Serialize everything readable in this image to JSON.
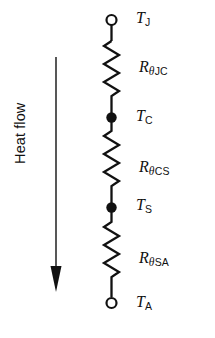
{
  "figure": {
    "colors": {
      "background": "#ffffff",
      "stroke": "#111111",
      "node_fill": "#111111",
      "terminal_fill": "#ffffff"
    }
  },
  "heat_flow": {
    "label": "Heat flow",
    "direction": "down",
    "arrow_icon": "down-arrow-icon"
  },
  "nodes": [
    {
      "id": "tj",
      "symbol": "T",
      "subscript": "J",
      "type": "terminal",
      "marker": "open-circle"
    },
    {
      "id": "tc",
      "symbol": "T",
      "subscript": "C",
      "type": "junction",
      "marker": "filled-dot"
    },
    {
      "id": "ts",
      "symbol": "T",
      "subscript": "S",
      "type": "junction",
      "marker": "filled-dot"
    },
    {
      "id": "ta",
      "symbol": "T",
      "subscript": "A",
      "type": "terminal",
      "marker": "open-circle"
    }
  ],
  "resistors": [
    {
      "id": "rjc",
      "symbol": "R",
      "sub_theta": "θ",
      "sub_rest": "JC",
      "between": [
        "tj",
        "tc"
      ]
    },
    {
      "id": "rcs",
      "symbol": "R",
      "sub_theta": "θ",
      "sub_rest": "CS",
      "between": [
        "tc",
        "ts"
      ]
    },
    {
      "id": "rsa",
      "symbol": "R",
      "sub_theta": "θ",
      "sub_rest": "SA",
      "between": [
        "ts",
        "ta"
      ]
    }
  ]
}
